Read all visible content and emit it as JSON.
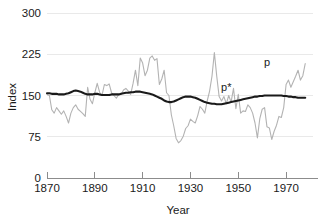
{
  "chart_data": {
    "type": "line",
    "title": "",
    "xlabel": "Year",
    "ylabel": "Index",
    "xlim": [
      1870,
      1980
    ],
    "ylim": [
      0,
      300
    ],
    "grid": true,
    "legend_position": "inline-annotations",
    "x_ticks": [
      "1870",
      "1890",
      "1910",
      "1930",
      "1950",
      "1970"
    ],
    "x_tick_values": [
      1870,
      1890,
      1910,
      1930,
      1950,
      1970
    ],
    "y_ticks": [
      "0",
      "75",
      "150",
      "225",
      "300"
    ],
    "y_tick_values": [
      0,
      75,
      150,
      225,
      300
    ],
    "annotations": [
      {
        "text": "p",
        "x": 1962,
        "y": 203,
        "color": "#1a1a1a"
      },
      {
        "text": "p*",
        "x": 1945,
        "y": 158,
        "color": "#1a1a1a"
      }
    ],
    "colors": {
      "series_p": "#b3b3b3",
      "series_pstar": "#1a1a1a",
      "grid": "#e9e9e9",
      "axis": "#8c8c8c",
      "background": "#ffffff"
    },
    "x": [
      1870,
      1871,
      1872,
      1873,
      1874,
      1875,
      1876,
      1877,
      1878,
      1879,
      1880,
      1881,
      1882,
      1883,
      1884,
      1885,
      1886,
      1887,
      1888,
      1889,
      1890,
      1891,
      1892,
      1893,
      1894,
      1895,
      1896,
      1897,
      1898,
      1899,
      1900,
      1901,
      1902,
      1903,
      1904,
      1905,
      1906,
      1907,
      1908,
      1909,
      1910,
      1911,
      1912,
      1913,
      1914,
      1915,
      1916,
      1917,
      1918,
      1919,
      1920,
      1921,
      1922,
      1923,
      1924,
      1925,
      1926,
      1927,
      1928,
      1929,
      1930,
      1931,
      1932,
      1933,
      1934,
      1935,
      1936,
      1937,
      1938,
      1939,
      1940,
      1941,
      1942,
      1943,
      1944,
      1945,
      1946,
      1947,
      1948,
      1949,
      1950,
      1951,
      1952,
      1953,
      1954,
      1955,
      1956,
      1957,
      1958,
      1959,
      1960,
      1961,
      1962,
      1963,
      1964,
      1965,
      1966,
      1967,
      1968,
      1969,
      1970,
      1971,
      1972,
      1973,
      1974,
      1975,
      1976,
      1977,
      1978
    ],
    "series": [
      {
        "name": "p",
        "color": "#b3b3b3",
        "values": [
          152,
          150,
          124,
          118,
          128,
          122,
          116,
          122,
          112,
          100,
          118,
          128,
          133,
          125,
          121,
          117,
          112,
          165,
          143,
          135,
          155,
          172,
          156,
          150,
          170,
          168,
          171,
          155,
          150,
          145,
          152,
          152,
          160,
          163,
          158,
          152,
          172,
          196,
          168,
          218,
          209,
          186,
          196,
          218,
          222,
          214,
          217,
          170,
          180,
          196,
          155,
          150,
          115,
          95,
          72,
          64,
          68,
          76,
          90,
          95,
          107,
          103,
          100,
          113,
          130,
          125,
          118,
          140,
          158,
          185,
          228,
          185,
          148,
          140,
          148,
          135,
          150,
          138,
          163,
          126,
          152,
          118,
          122,
          121,
          133,
          128,
          118,
          100,
          73,
          108,
          125,
          128,
          93,
          91,
          70,
          85,
          96,
          112,
          110,
          128,
          170,
          178,
          165,
          175,
          185,
          196,
          178,
          186,
          208
        ]
      },
      {
        "name": "p*",
        "color": "#1a1a1a",
        "values": [
          154,
          154,
          153,
          153,
          153,
          152,
          152,
          152,
          153,
          154,
          156,
          158,
          159,
          158,
          157,
          155,
          153,
          152,
          152,
          152,
          153,
          153,
          152,
          151,
          151,
          151,
          151,
          152,
          152,
          152,
          152,
          153,
          154,
          155,
          155,
          156,
          156,
          157,
          157,
          157,
          156,
          155,
          154,
          153,
          152,
          150,
          148,
          146,
          144,
          141,
          139,
          138,
          138,
          139,
          141,
          143,
          145,
          147,
          148,
          148,
          148,
          147,
          146,
          144,
          142,
          140,
          138,
          137,
          136,
          135,
          135,
          134,
          134,
          134,
          135,
          136,
          137,
          138,
          139,
          140,
          141,
          142,
          143,
          144,
          145,
          146,
          147,
          148,
          148,
          149,
          149,
          150,
          150,
          150,
          150,
          150,
          150,
          150,
          150,
          149,
          149,
          148,
          148,
          147,
          147,
          146,
          146,
          146,
          146
        ]
      }
    ]
  },
  "axis": {
    "y_label": "Index",
    "x_label": "Year"
  }
}
